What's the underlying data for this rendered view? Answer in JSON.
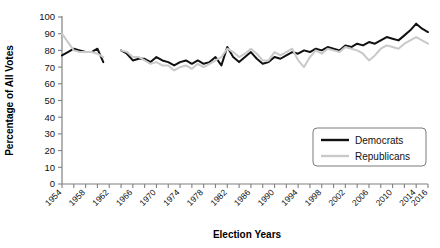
{
  "chart_data": {
    "type": "line",
    "title": "",
    "xlabel": "Election Years",
    "ylabel": "Percentage of All Votes",
    "ylim": [
      0,
      100
    ],
    "ytick_step": 10,
    "yticks": [
      0,
      10,
      20,
      30,
      40,
      50,
      60,
      70,
      80,
      90,
      100
    ],
    "xlim": [
      1954,
      2016
    ],
    "xticks_all": [
      1954,
      1956,
      1958,
      1960,
      1962,
      1964,
      1966,
      1968,
      1970,
      1972,
      1974,
      1976,
      1978,
      1980,
      1982,
      1984,
      1986,
      1988,
      1990,
      1992,
      1994,
      1996,
      1998,
      2000,
      2002,
      2004,
      2006,
      2008,
      2010,
      2012,
      2014,
      2016
    ],
    "xtick_labels": [
      "1954",
      "1958",
      "1962",
      "1966",
      "1970",
      "1974",
      "1978",
      "1982",
      "1986",
      "1990",
      "1994",
      "1998",
      "2002",
      "2006",
      "2010",
      "2014",
      "2016"
    ],
    "grid": false,
    "legend_position": "inside-bottom-right",
    "series": [
      {
        "name": "Democrats",
        "color": "#111111",
        "x": [
          1954,
          1955,
          1956,
          1957,
          1958,
          1959,
          1960,
          1961,
          1964,
          1965,
          1966,
          1967,
          1968,
          1969,
          1970,
          1971,
          1972,
          1973,
          1974,
          1975,
          1976,
          1977,
          1978,
          1979,
          1980,
          1981,
          1982,
          1983,
          1984,
          1985,
          1986,
          1987,
          1988,
          1989,
          1990,
          1991,
          1992,
          1993,
          1994,
          1995,
          1996,
          1997,
          1998,
          1999,
          2000,
          2001,
          2002,
          2003,
          2004,
          2005,
          2006,
          2007,
          2008,
          2009,
          2010,
          2011,
          2012,
          2013,
          2014,
          2015,
          2016
        ],
        "values": [
          77,
          79,
          81,
          80,
          79,
          79,
          81,
          73,
          80,
          78,
          74,
          75,
          75,
          73,
          76,
          74,
          73,
          71,
          73,
          74,
          72,
          74,
          72,
          73,
          76,
          71,
          82,
          76,
          73,
          76,
          79,
          75,
          72,
          73,
          76,
          75,
          77,
          79,
          78,
          80,
          79,
          81,
          80,
          82,
          81,
          80,
          83,
          82,
          84,
          83,
          85,
          84,
          86,
          88,
          87,
          86,
          89,
          92,
          96,
          93,
          91
        ]
      },
      {
        "name": "Republicans",
        "color": "#c9c9c9",
        "x": [
          1954,
          1955,
          1956,
          1957,
          1958,
          1959,
          1960,
          1961,
          1964,
          1965,
          1966,
          1967,
          1968,
          1969,
          1970,
          1971,
          1972,
          1973,
          1974,
          1975,
          1976,
          1977,
          1978,
          1979,
          1980,
          1981,
          1982,
          1983,
          1984,
          1985,
          1986,
          1987,
          1988,
          1989,
          1990,
          1991,
          1992,
          1993,
          1994,
          1995,
          1996,
          1997,
          1998,
          1999,
          2000,
          2001,
          2002,
          2003,
          2004,
          2005,
          2006,
          2007,
          2008,
          2009,
          2010,
          2011,
          2012,
          2013,
          2014,
          2015,
          2016
        ],
        "values": [
          90,
          85,
          80,
          79,
          79,
          79,
          78,
          76,
          80,
          79,
          76,
          76,
          74,
          72,
          73,
          71,
          71,
          68,
          70,
          71,
          69,
          72,
          70,
          72,
          74,
          76,
          81,
          79,
          76,
          78,
          81,
          78,
          74,
          74,
          79,
          77,
          79,
          81,
          74,
          70,
          76,
          80,
          78,
          81,
          80,
          79,
          82,
          81,
          80,
          78,
          74,
          77,
          81,
          83,
          82,
          81,
          84,
          86,
          88,
          86,
          84
        ]
      }
    ]
  },
  "legend": {
    "items": [
      {
        "label": "Democrats"
      },
      {
        "label": "Republicans"
      }
    ]
  },
  "axis_titles": {
    "x": "Election Years",
    "y": "Percentage of All Votes"
  }
}
